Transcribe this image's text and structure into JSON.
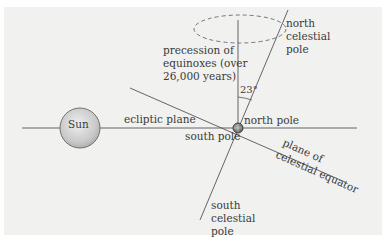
{
  "diagram": {
    "colors": {
      "panel_background": "#f1f1f0",
      "line": "#555555",
      "sun_fill": "#cfcfcf",
      "earth_fill": "#8a8a8a",
      "text": "#3a3a3a"
    },
    "nodes": {
      "sun": {
        "label": "Sun"
      },
      "earth": {
        "label": "Earth"
      }
    },
    "labels": {
      "ecliptic_plane": "ecliptic plane",
      "north_pole": "north pole",
      "south_pole": "south pole",
      "north_celestial_pole_1": "north",
      "north_celestial_pole_2": "celestial",
      "north_celestial_pole_3": "pole",
      "south_celestial_pole_1": "south",
      "south_celestial_pole_2": "celestial",
      "south_celestial_pole_3": "pole",
      "precession_1": "precession of",
      "precession_2": "equinoxes (over",
      "precession_3": "26,000 years)",
      "angle": "23°",
      "celestial_equator_1": "plane of",
      "celestial_equator_2": "celestial equator"
    }
  }
}
